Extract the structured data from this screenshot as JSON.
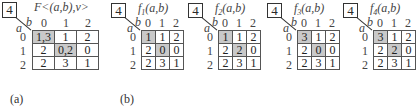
{
  "captions": {
    "a": "(a)",
    "b": "(b)"
  },
  "node_label": "4",
  "axis": {
    "row": "a",
    "col": "b",
    "col_headers": [
      "0",
      "1",
      "2"
    ],
    "row_headers": [
      "0",
      "1",
      "2"
    ]
  },
  "panels": [
    {
      "id": "F",
      "title": "F<(a,b),v>",
      "rows": [
        [
          "1,3",
          "1",
          "2"
        ],
        [
          "2",
          "0,2",
          "0"
        ],
        [
          "2",
          "3",
          "1"
        ]
      ],
      "highlight": [
        [
          0,
          0
        ],
        [
          1,
          1
        ]
      ]
    },
    {
      "id": "f1",
      "title_fn": "f",
      "title_sub": "1",
      "title_args": "(a,b)",
      "rows": [
        [
          "1",
          "1",
          "2"
        ],
        [
          "2",
          "0",
          "0"
        ],
        [
          "2",
          "3",
          "1"
        ]
      ],
      "highlight": [
        [
          0,
          0
        ],
        [
          1,
          1
        ]
      ]
    },
    {
      "id": "f2",
      "title_fn": "f",
      "title_sub": "2",
      "title_args": "(a,b)",
      "rows": [
        [
          "1",
          "1",
          "2"
        ],
        [
          "2",
          "2",
          "0"
        ],
        [
          "2",
          "3",
          "1"
        ]
      ],
      "highlight": [
        [
          0,
          0
        ],
        [
          1,
          1
        ]
      ]
    },
    {
      "id": "f3",
      "title_fn": "f",
      "title_sub": "3",
      "title_args": "(a,b)",
      "rows": [
        [
          "3",
          "1",
          "2"
        ],
        [
          "2",
          "0",
          "0"
        ],
        [
          "2",
          "3",
          "1"
        ]
      ],
      "highlight": [
        [
          0,
          0
        ],
        [
          1,
          1
        ]
      ]
    },
    {
      "id": "f4",
      "title_fn": "f",
      "title_sub": "4",
      "title_args": "(a,b)",
      "rows": [
        [
          "3",
          "1",
          "2"
        ],
        [
          "2",
          "2",
          "0"
        ],
        [
          "2",
          "3",
          "1"
        ]
      ],
      "highlight": [
        [
          0,
          0
        ],
        [
          1,
          1
        ]
      ]
    }
  ]
}
